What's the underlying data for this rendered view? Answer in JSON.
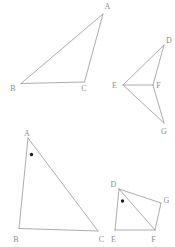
{
  "canvas": {
    "width": 175,
    "height": 247,
    "background": "#ffffff"
  },
  "style": {
    "stroke_color": "#979797",
    "stroke_width": 0.8,
    "label_color": "#8e8e8e",
    "dot_color": "#1c1c1c"
  },
  "figures": [
    {
      "id": "triangle-ABC-top-left",
      "vertices": {
        "A": [
          103,
          14
        ],
        "B": [
          21,
          83.5
        ],
        "C": [
          84.5,
          82
        ]
      },
      "edges": [
        [
          "A",
          "B"
        ],
        [
          "A",
          "C"
        ],
        [
          "B",
          "C"
        ]
      ],
      "labels": [
        {
          "text": "A",
          "x": 107.5,
          "y": 9
        },
        {
          "text": "B",
          "x": 13,
          "y": 91
        },
        {
          "text": "C",
          "x": 84,
          "y": 91
        }
      ],
      "dots": []
    },
    {
      "id": "figure-DEFG-top-right",
      "vertices": {
        "D": [
          164,
          45
        ],
        "E": [
          123,
          85
        ],
        "F": [
          153,
          85
        ],
        "G": [
          164,
          123
        ]
      },
      "edges": [
        [
          "D",
          "E"
        ],
        [
          "D",
          "F"
        ],
        [
          "E",
          "F"
        ],
        [
          "E",
          "G"
        ],
        [
          "F",
          "G"
        ]
      ],
      "labels": [
        {
          "text": "D",
          "x": 169,
          "y": 43
        },
        {
          "text": "E",
          "x": 114.5,
          "y": 88
        },
        {
          "text": "F",
          "x": 158.5,
          "y": 88
        },
        {
          "text": "G",
          "x": 164,
          "y": 134
        }
      ],
      "dots": []
    },
    {
      "id": "triangle-ABC-bottom-left",
      "vertices": {
        "A": [
          28,
          138
        ],
        "B": [
          19,
          228.5
        ],
        "C": [
          98,
          231
        ]
      },
      "edges": [
        [
          "A",
          "B"
        ],
        [
          "A",
          "C"
        ],
        [
          "B",
          "C"
        ]
      ],
      "labels": [
        {
          "text": "A",
          "x": 27,
          "y": 136
        },
        {
          "text": "B",
          "x": 16,
          "y": 241.5
        },
        {
          "text": "C",
          "x": 101.5,
          "y": 241.5
        }
      ],
      "dots": [
        {
          "x": 31.5,
          "y": 154.5,
          "r": 1.7
        }
      ]
    },
    {
      "id": "figure-DEFG-bottom-right",
      "vertices": {
        "D": [
          119,
          189
        ],
        "E": [
          115,
          230
        ],
        "F": [
          155,
          230
        ],
        "G": [
          161,
          203
        ]
      },
      "edges": [
        [
          "D",
          "E"
        ],
        [
          "D",
          "G"
        ],
        [
          "G",
          "F"
        ],
        [
          "E",
          "F"
        ],
        [
          "D",
          "F"
        ]
      ],
      "labels": [
        {
          "text": "D",
          "x": 113.5,
          "y": 186.5
        },
        {
          "text": "E",
          "x": 113.5,
          "y": 241.5
        },
        {
          "text": "F",
          "x": 153.5,
          "y": 242
        },
        {
          "text": "G",
          "x": 166.5,
          "y": 202.5
        }
      ],
      "dots": [
        {
          "x": 122.5,
          "y": 201,
          "r": 1.7
        }
      ]
    }
  ]
}
